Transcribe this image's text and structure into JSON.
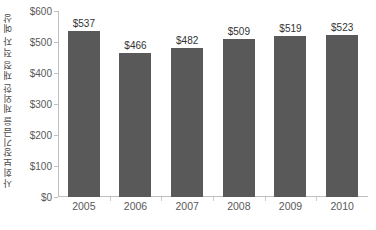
{
  "chart_data": {
    "type": "bar",
    "title": "",
    "subtitle": "",
    "xlabel": "",
    "ylabel": "사회보장기금을 제외한 재정 적자 예상",
    "categories": [
      "2005",
      "2006",
      "2007",
      "2008",
      "2009",
      "2010"
    ],
    "values": [
      537,
      466,
      482,
      509,
      519,
      523
    ],
    "data_labels": [
      "$537",
      "$466",
      "$482",
      "$509",
      "$519",
      "$523"
    ],
    "series": [
      {
        "name": "사회보장기금을 제외한 재정 적자 예상",
        "values": [
          537,
          466,
          482,
          509,
          519,
          523
        ]
      }
    ],
    "ylim": [
      0,
      600
    ],
    "ytick_values": [
      0,
      100,
      200,
      300,
      400,
      500,
      600
    ],
    "ytick_labels": [
      "$0",
      "$100",
      "$200",
      "$300",
      "$400",
      "$500",
      "$600"
    ],
    "grid": false,
    "legend": false,
    "legend_position": "none",
    "bar_color": "#595959",
    "axis_color": "#bfbfbf",
    "tick_label_color": "#595959",
    "data_label_color": "#333333",
    "background_color": "#ffffff"
  }
}
